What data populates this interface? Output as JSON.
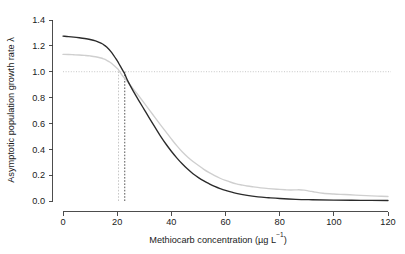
{
  "chart_data": {
    "type": "line",
    "title": "",
    "xlabel": "Methiocarb concentration (µg L⁻¹)",
    "xlabel_main": "Methiocarb concentration (µg L",
    "xlabel_sup": "−1",
    "xlabel_tail": ")",
    "ylabel": "Asymptotic population growth rate λ",
    "xlim": [
      0,
      120
    ],
    "ylim": [
      0.0,
      1.4
    ],
    "xticks": [
      0,
      20,
      40,
      60,
      80,
      100,
      120
    ],
    "xticklabels": [
      "0",
      "20",
      "40",
      "60",
      "80",
      "100",
      "120"
    ],
    "yticks": [
      0.0,
      0.2,
      0.4,
      0.6,
      0.8,
      1.0,
      1.2,
      1.4
    ],
    "yticklabels": [
      "0.0",
      "0.2",
      "0.4",
      "0.6",
      "0.8",
      "1.0",
      "1.2",
      "1.4"
    ],
    "grid": false,
    "legend": "none",
    "annotations": [
      {
        "name": "lambda-one-reference",
        "type": "hline",
        "y": 1.0,
        "style": "dotted",
        "color": "#bdbdbd"
      },
      {
        "name": "ec50-grey-marker",
        "type": "vline",
        "x": 20.5,
        "style": "dotted",
        "color": "#bdbdbd"
      },
      {
        "name": "ec50-black-marker",
        "type": "vline",
        "x": 22.8,
        "style": "dotted",
        "color": "#3a3a3a"
      }
    ],
    "series": [
      {
        "name": "black-curve",
        "color": "#2b2b2b",
        "width": 1.35,
        "x": [
          0,
          2,
          4,
          6,
          8,
          10,
          12,
          14,
          15,
          16,
          18,
          20,
          21,
          22,
          22.8,
          24,
          26,
          28,
          30,
          32,
          34,
          36,
          38,
          40,
          42,
          44,
          46,
          48,
          50,
          52,
          54,
          56,
          58,
          60,
          64,
          68,
          72,
          76,
          80,
          86,
          92,
          100,
          110,
          120
        ],
        "y": [
          1.275,
          1.272,
          1.268,
          1.263,
          1.257,
          1.249,
          1.238,
          1.221,
          1.209,
          1.193,
          1.148,
          1.085,
          1.049,
          1.012,
          0.982,
          0.925,
          0.848,
          0.777,
          0.707,
          0.637,
          0.569,
          0.502,
          0.441,
          0.385,
          0.334,
          0.288,
          0.247,
          0.211,
          0.181,
          0.155,
          0.133,
          0.113,
          0.096,
          0.082,
          0.059,
          0.043,
          0.032,
          0.025,
          0.019,
          0.013,
          0.01,
          0.007,
          0.005,
          0.004
        ]
      },
      {
        "name": "grey-curve",
        "color": "#cfcfcf",
        "width": 1.35,
        "x": [
          0,
          2,
          4,
          6,
          8,
          10,
          12,
          14,
          15,
          16,
          17,
          18,
          20,
          20.5,
          22,
          24,
          26,
          28,
          30,
          32,
          34,
          36,
          38,
          40,
          42,
          44,
          46,
          48,
          50,
          52,
          54,
          56,
          58,
          60,
          62,
          64,
          66,
          68,
          70,
          73,
          76,
          79,
          82,
          84,
          86,
          87,
          89,
          91,
          93,
          96,
          100,
          104,
          108,
          112,
          116,
          120
        ],
        "y": [
          1.134,
          1.133,
          1.131,
          1.129,
          1.126,
          1.122,
          1.116,
          1.106,
          1.099,
          1.09,
          1.078,
          1.064,
          1.026,
          1.015,
          0.968,
          0.92,
          0.866,
          0.812,
          0.757,
          0.701,
          0.645,
          0.589,
          0.534,
          0.48,
          0.428,
          0.381,
          0.341,
          0.306,
          0.275,
          0.245,
          0.219,
          0.196,
          0.176,
          0.159,
          0.145,
          0.133,
          0.124,
          0.116,
          0.11,
          0.102,
          0.096,
          0.091,
          0.087,
          0.085,
          0.086,
          0.087,
          0.084,
          0.077,
          0.069,
          0.06,
          0.054,
          0.05,
          0.046,
          0.042,
          0.038,
          0.035
        ]
      }
    ]
  }
}
